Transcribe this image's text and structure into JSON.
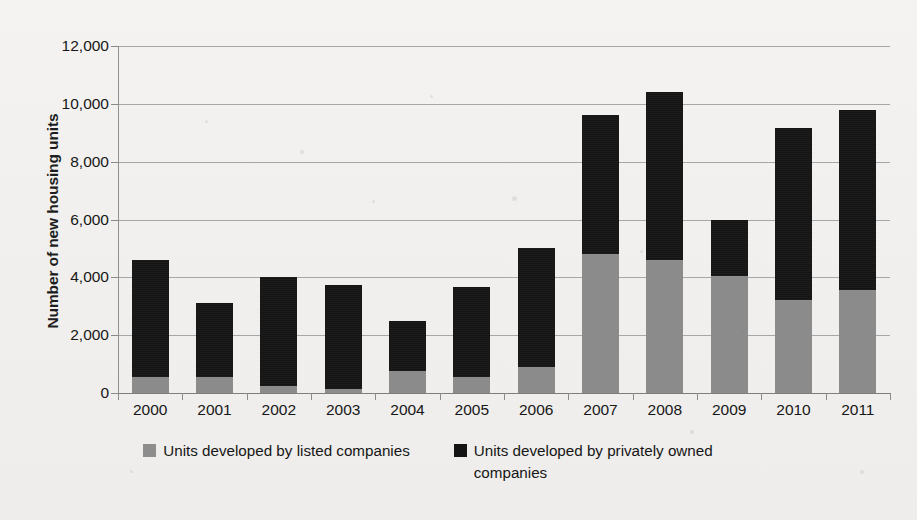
{
  "chart_data": {
    "type": "bar",
    "subtype": "stacked-bar",
    "title": "",
    "xlabel": "",
    "ylabel": "Number of new housing units",
    "ylim": [
      0,
      12000
    ],
    "ytick_values": [
      0,
      2000,
      4000,
      6000,
      8000,
      10000,
      12000
    ],
    "ytick_labels": [
      "0",
      "2,000",
      "4,000",
      "6,000",
      "8,000",
      "10,000",
      "12,000"
    ],
    "grid": true,
    "legend_position": "bottom",
    "categories": [
      "2000",
      "2001",
      "2002",
      "2003",
      "2004",
      "2005",
      "2006",
      "2007",
      "2008",
      "2009",
      "2010",
      "2011"
    ],
    "series": [
      {
        "name": "Units developed by listed companies",
        "color": "#8d8d8d",
        "values": [
          550,
          550,
          250,
          150,
          750,
          550,
          900,
          4800,
          4600,
          4050,
          3200,
          3550
        ]
      },
      {
        "name": "Units developed by privately owned companies",
        "color": "#141414",
        "values": [
          4050,
          2550,
          3750,
          3600,
          1750,
          3100,
          4100,
          4800,
          5800,
          1950,
          5950,
          6250
        ]
      }
    ],
    "totals": [
      4600,
      3100,
      4000,
      3750,
      2500,
      3650,
      5000,
      9600,
      10400,
      6000,
      9150,
      9800
    ]
  },
  "legend": {
    "items": [
      {
        "label": "Units developed by listed companies",
        "swatch": "listed"
      },
      {
        "label": "Units developed by privately owned companies",
        "swatch": "private"
      }
    ]
  },
  "colors": {
    "listed": "#8d8d8d",
    "private": "#141414",
    "grid": "#9a9a9a",
    "background": "#f2f1ef",
    "text": "#171717"
  }
}
